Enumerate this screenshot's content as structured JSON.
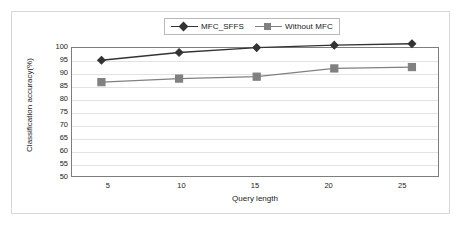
{
  "chart_data": {
    "type": "line",
    "title": "",
    "xlabel": "Query length",
    "ylabel": "Classification accuracy(%)",
    "x": [
      5,
      10,
      15,
      20,
      25
    ],
    "xticklabels": [
      "5",
      "10",
      "15",
      "20",
      "25"
    ],
    "yticklabels": [
      "100",
      "95",
      "90",
      "85",
      "80",
      "75",
      "70",
      "65",
      "60",
      "55",
      "50"
    ],
    "yticks": [
      100,
      95,
      90,
      85,
      80,
      75,
      70,
      65,
      60,
      55,
      50
    ],
    "ylim": [
      50,
      100
    ],
    "xlim": [
      2.5,
      27.5
    ],
    "grid": "horizontal",
    "legend_position": "top-center",
    "series": [
      {
        "name": "MFC_SFFS",
        "marker": "diamond",
        "color": "#333333",
        "values": [
          94,
          96.8,
          98.6,
          99.5,
          100
        ]
      },
      {
        "name": "Without MFC",
        "marker": "square",
        "color": "#808080",
        "values": [
          86,
          87.3,
          88,
          91,
          91.5
        ]
      }
    ]
  },
  "legend": {
    "entries": [
      {
        "label": "MFC_SFFS"
      },
      {
        "label": "Without MFC"
      }
    ]
  },
  "axes": {
    "x_title": "Query length",
    "y_title": "Classification accuracy(%)"
  },
  "colors": {
    "series1": "#333333",
    "series2": "#808080",
    "gridline": "#e2e2e2",
    "plot_border": "#7d7d7d",
    "figure_border": "#d8d8d8",
    "background": "#ffffff"
  }
}
